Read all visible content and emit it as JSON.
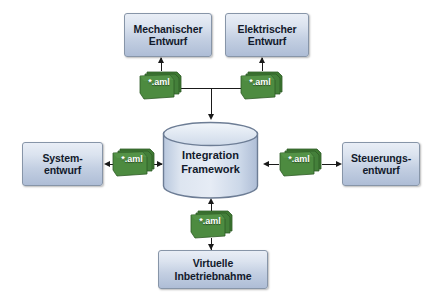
{
  "diagram": {
    "colors": {
      "box_fill_top": "#e9eef6",
      "box_fill_bottom": "#aebdd6",
      "box_border": "#8795a8",
      "cylinder_fill": "#ced9ea",
      "cylinder_border": "#6d7d95",
      "file_green": "#4a8a3d",
      "connector": "#1a1a1a",
      "background": "#ffffff"
    },
    "center": {
      "label_line1": "Integration",
      "label_line2": "Framework",
      "icon": "database-cylinder-icon"
    },
    "boxes": [
      {
        "id": "mechanischer-entwurf",
        "line1": "Mechanischer",
        "line2": "Entwurf"
      },
      {
        "id": "elektrischer-entwurf",
        "line1": "Elektrischer",
        "line2": "Entwurf"
      },
      {
        "id": "systementwurf",
        "line1": "System-",
        "line2": "entwurf"
      },
      {
        "id": "steuerungsentwurf",
        "line1": "Steuerungs-",
        "line2": "entwurf"
      },
      {
        "id": "virtuelle-inbetriebnahme",
        "line1": "Virtuelle",
        "line2": "Inbetriebnahme"
      }
    ],
    "files": [
      {
        "id": "aml-mechanisch",
        "label": "*.aml"
      },
      {
        "id": "aml-elektrisch",
        "label": "*.aml"
      },
      {
        "id": "aml-system",
        "label": "*.aml"
      },
      {
        "id": "aml-steuerung",
        "label": "*.aml"
      },
      {
        "id": "aml-virtuelle",
        "label": "*.aml"
      }
    ]
  }
}
